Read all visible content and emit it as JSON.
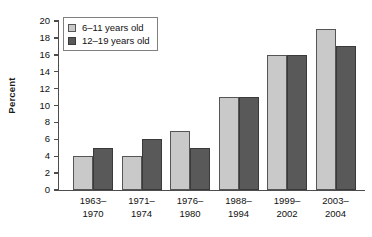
{
  "chart_data": {
    "type": "bar",
    "title": "",
    "xlabel": "",
    "ylabel": "Percent",
    "ylim": [
      0,
      20
    ],
    "yticks": [
      0,
      2,
      4,
      6,
      8,
      10,
      12,
      14,
      16,
      18,
      20
    ],
    "ytick_labels": [
      "0",
      "2",
      "4",
      "6",
      "8",
      "10",
      "12",
      "14",
      "16",
      "18",
      "20"
    ],
    "grid": false,
    "legend_position": "upper left",
    "categories": [
      {
        "line1": "1963–",
        "line2": "1970"
      },
      {
        "line1": "1971–",
        "line2": "1974"
      },
      {
        "line1": "1976–",
        "line2": "1980"
      },
      {
        "line1": "1988–",
        "line2": "1994"
      },
      {
        "line1": "1999–",
        "line2": "2002"
      },
      {
        "line1": "2003–",
        "line2": "2004"
      }
    ],
    "category_labels": [
      "1963–1970",
      "1971–1974",
      "1976–1980",
      "1988–1994",
      "1999–2002",
      "2003–2004"
    ],
    "series": [
      {
        "name": "6–11 years old",
        "color": "#c9c9c9",
        "values": [
          4,
          4,
          7,
          11,
          16,
          19
        ]
      },
      {
        "name": "12–19 years old",
        "color": "#595959",
        "values": [
          5,
          6,
          5,
          11,
          16,
          17
        ]
      }
    ]
  },
  "legend": {
    "items": [
      {
        "label": "6–11 years old"
      },
      {
        "label": "12–19 years old"
      }
    ]
  }
}
